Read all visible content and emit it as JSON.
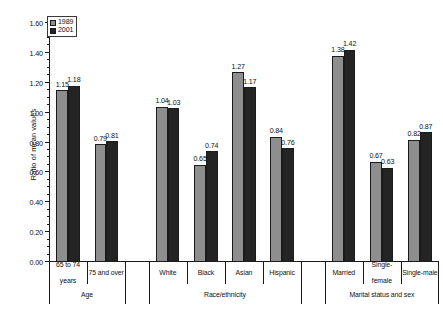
{
  "chart_data": {
    "type": "bar",
    "title": "",
    "xlabel": "",
    "ylabel": "Ratio of mean values",
    "ylim": [
      0.0,
      1.6
    ],
    "ytick_step": 0.2,
    "yminor_step": 0.05,
    "grid": false,
    "legend_position": "upper-left-inside",
    "categories": [
      "65 to 74 years",
      "75 and over",
      "White",
      "Black",
      "Asian",
      "Hispanic",
      "Married",
      "Single-female",
      "Single-male"
    ],
    "groups": [
      {
        "label": "Age",
        "categories": [
          "65 to 74 years",
          "75 and over"
        ]
      },
      {
        "label": "Race/ethnicity",
        "categories": [
          "White",
          "Black",
          "Asian",
          "Hispanic"
        ]
      },
      {
        "label": "Marital status and sex",
        "categories": [
          "Married",
          "Single-female",
          "Single-male"
        ]
      }
    ],
    "series": [
      {
        "name": "1989",
        "color": "#8e8e8e",
        "values": [
          1.15,
          0.79,
          1.04,
          0.65,
          1.27,
          0.84,
          1.38,
          0.67,
          0.82
        ]
      },
      {
        "name": "2001",
        "color": "#242424",
        "values": [
          1.18,
          0.81,
          1.03,
          0.74,
          1.17,
          0.76,
          1.42,
          0.63,
          0.87
        ]
      }
    ],
    "ytick_labels": [
      "0.00",
      "0.20",
      "0.40",
      "0.60",
      "0.80",
      "1.00",
      "1.20",
      "1.40",
      "1.60"
    ],
    "ytick_values": [
      0.0,
      0.2,
      0.4,
      0.6,
      0.8,
      1.0,
      1.2,
      1.4,
      1.6
    ],
    "value_labels": {
      "1989": [
        "1.15",
        "0.79",
        "1.04",
        "0.65",
        "1.27",
        "0.84",
        "1.38",
        "0.67",
        "0.82"
      ],
      "2001": [
        "1.18",
        "0.81",
        "1.03",
        "0.74",
        "1.17",
        "0.76",
        "1.42",
        "0.63",
        "0.87"
      ]
    },
    "category_labels_display": [
      [
        "65 to 74",
        "years"
      ],
      [
        "75 and over"
      ],
      [
        "White"
      ],
      [
        "Black"
      ],
      [
        "Asian"
      ],
      [
        "Hispanic"
      ],
      [
        "Married"
      ],
      [
        "Single-",
        "female"
      ],
      [
        "Single-male"
      ]
    ]
  },
  "legend": {
    "items": [
      {
        "label": "1989",
        "swatch": "light-gray-square"
      },
      {
        "label": "2001",
        "swatch": "black-square"
      }
    ]
  },
  "axis": {
    "y_title": "Ratio of mean values"
  }
}
